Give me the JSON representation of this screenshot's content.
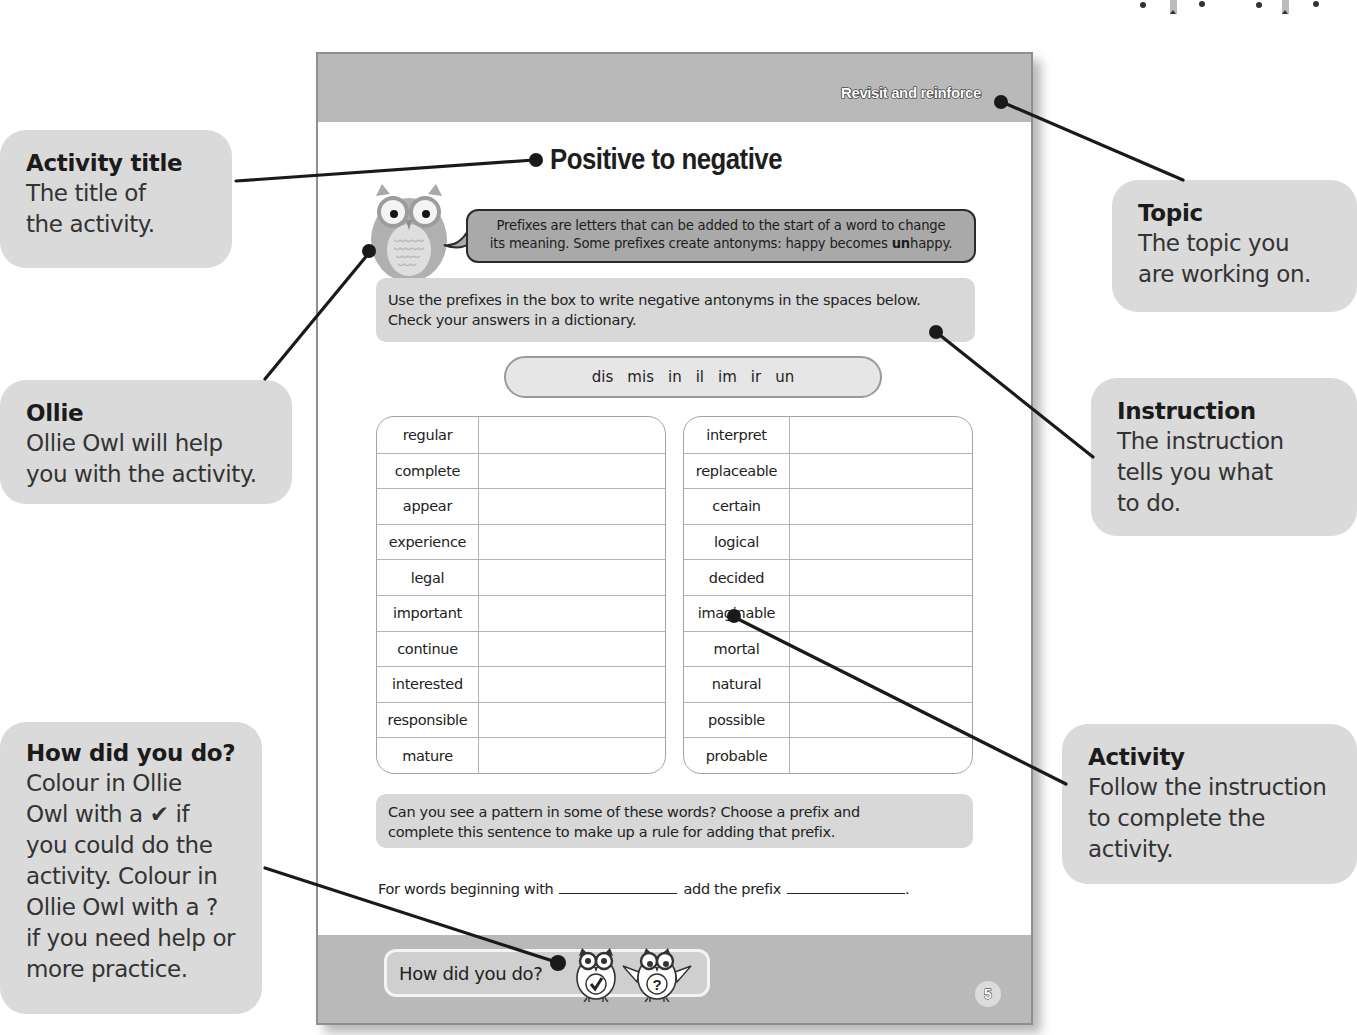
{
  "callouts": {
    "activity_title": {
      "title": "Activity title",
      "body_lines": [
        "The title of",
        "the activity."
      ]
    },
    "ollie": {
      "title": "Ollie",
      "body_lines": [
        "Ollie Owl will help",
        "you with the activity."
      ]
    },
    "how_did_you_do": {
      "title": "How did you do?",
      "body_lines": [
        "Colour in Ollie",
        "Owl with a ✔ if",
        "you could do the",
        "activity. Colour in",
        "Ollie Owl with a ?",
        "if you need help or",
        "more practice."
      ]
    },
    "topic": {
      "title": "Topic",
      "body_lines": [
        "The topic you",
        "are working on."
      ]
    },
    "instruction": {
      "title": "Instruction",
      "body_lines": [
        "The instruction",
        "tells you what",
        "to do."
      ]
    },
    "activity": {
      "title": "Activity",
      "body_lines": [
        "Follow the instruction",
        "to complete the",
        "activity."
      ]
    }
  },
  "page": {
    "topic_label": "Revisit and reinforce",
    "title": "Positive to negative",
    "speech_bubble": {
      "line1": "Prefixes are letters that can be added to the start of a word to change",
      "line2_pre": "its meaning. Some prefixes create antonyms: happy becomes ",
      "line2_bold": "un",
      "line2_post": "happy."
    },
    "instruction": {
      "line1": "Use the prefixes in the box to write negative antonyms in the spaces below.",
      "line2": "Check your answers in a dictionary."
    },
    "prefixes": [
      "dis",
      "mis",
      "in",
      "il",
      "im",
      "ir",
      "un"
    ],
    "left_words": [
      "regular",
      "complete",
      "appear",
      "experience",
      "legal",
      "important",
      "continue",
      "interested",
      "responsible",
      "mature"
    ],
    "right_words": [
      "interpret",
      "replaceable",
      "certain",
      "logical",
      "decided",
      "imaginable",
      "mortal",
      "natural",
      "possible",
      "probable"
    ],
    "pattern_question": {
      "line1": "Can you see a pattern in some of these words? Choose a prefix and",
      "line2": "complete this sentence to make up a rule for adding that prefix."
    },
    "rule_sentence": {
      "part1": "For words beginning with",
      "part2": "add the prefix",
      "end": "."
    },
    "self_assessment": {
      "label": "How did you do?",
      "icons": [
        "owl-check-icon",
        "owl-question-icon"
      ]
    },
    "page_number": "5"
  },
  "colors": {
    "band_gray": "#b9b9b9",
    "callout_gray": "#dadada",
    "bubble_gray": "#a9a9a9",
    "instruction_gray": "#d8d8d8",
    "line": "#1a1a1a"
  }
}
